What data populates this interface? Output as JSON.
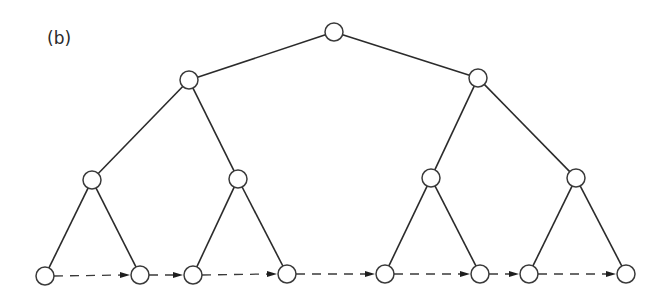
{
  "figure": {
    "panel_label": "(b)",
    "colors": {
      "edge": "#2b2b2b",
      "node_fill": "#ffffff",
      "node_stroke": "#3a3a3a",
      "link": "#3a3a3a"
    }
  },
  "tree": {
    "node_radius": 9,
    "nodes": [
      {
        "id": "root",
        "level": 0,
        "x": 334,
        "y": 32
      },
      {
        "id": "L1-0",
        "level": 1,
        "x": 189,
        "y": 80
      },
      {
        "id": "L1-1",
        "level": 1,
        "x": 478,
        "y": 78
      },
      {
        "id": "L2-0",
        "level": 2,
        "x": 92,
        "y": 180
      },
      {
        "id": "L2-1",
        "level": 2,
        "x": 238,
        "y": 179
      },
      {
        "id": "L2-2",
        "level": 2,
        "x": 431,
        "y": 178
      },
      {
        "id": "L2-3",
        "level": 2,
        "x": 576,
        "y": 178
      },
      {
        "id": "leaf-0",
        "level": 3,
        "x": 45,
        "y": 276
      },
      {
        "id": "leaf-1",
        "level": 3,
        "x": 140,
        "y": 275
      },
      {
        "id": "leaf-2",
        "level": 3,
        "x": 193,
        "y": 275
      },
      {
        "id": "leaf-3",
        "level": 3,
        "x": 287,
        "y": 274
      },
      {
        "id": "leaf-4",
        "level": 3,
        "x": 385,
        "y": 274
      },
      {
        "id": "leaf-5",
        "level": 3,
        "x": 480,
        "y": 274
      },
      {
        "id": "leaf-6",
        "level": 3,
        "x": 529,
        "y": 274
      },
      {
        "id": "leaf-7",
        "level": 3,
        "x": 626,
        "y": 274
      }
    ],
    "edges": [
      [
        "root",
        "L1-0"
      ],
      [
        "root",
        "L1-1"
      ],
      [
        "L1-0",
        "L2-0"
      ],
      [
        "L1-0",
        "L2-1"
      ],
      [
        "L1-1",
        "L2-2"
      ],
      [
        "L1-1",
        "L2-3"
      ],
      [
        "L2-0",
        "leaf-0"
      ],
      [
        "L2-0",
        "leaf-1"
      ],
      [
        "L2-1",
        "leaf-2"
      ],
      [
        "L2-1",
        "leaf-3"
      ],
      [
        "L2-2",
        "leaf-4"
      ],
      [
        "L2-2",
        "leaf-5"
      ],
      [
        "L2-3",
        "leaf-6"
      ],
      [
        "L2-3",
        "leaf-7"
      ]
    ],
    "leaf_links": [
      [
        "leaf-0",
        "leaf-1"
      ],
      [
        "leaf-1",
        "leaf-2"
      ],
      [
        "leaf-2",
        "leaf-3"
      ],
      [
        "leaf-3",
        "leaf-4"
      ],
      [
        "leaf-4",
        "leaf-5"
      ],
      [
        "leaf-5",
        "leaf-6"
      ],
      [
        "leaf-6",
        "leaf-7"
      ]
    ]
  }
}
